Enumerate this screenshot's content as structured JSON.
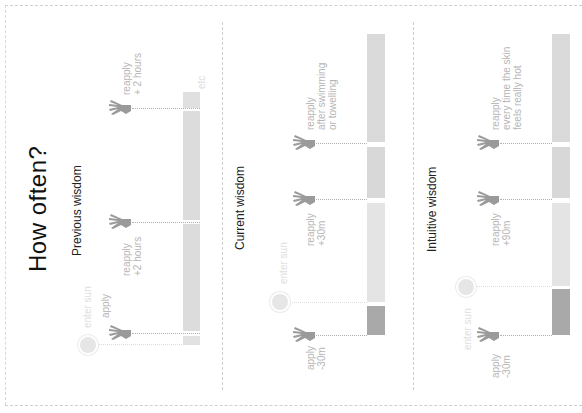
{
  "title": "How often?",
  "colors": {
    "bar_light": "#e2e2e2",
    "bar_mid": "#d6d6d6",
    "bar_dark": "#a9a9a9",
    "label": "#b5b5b5",
    "label_faint": "#dedede",
    "hand": "#9a9a9a"
  },
  "sections": [
    {
      "title": "Previous wisdom",
      "labels": {
        "enter_sun": "enter sun",
        "apply": "apply",
        "reapply1_a": "reapply",
        "reapply1_b": "+2 hours",
        "reapply2_a": "reapply",
        "reapply2_b": "+ 2 hours",
        "etc": "etc"
      }
    },
    {
      "title": "Current wisdom",
      "labels": {
        "enter_sun": "enter sun",
        "apply_a": "apply",
        "apply_b": "-30m",
        "reapply1_a": "reapply",
        "reapply1_b": "+30m",
        "reapply2_a": "reapply",
        "reapply2_b": "after swimming",
        "reapply2_c": "or towelling"
      }
    },
    {
      "title": "Intuitive wisdom",
      "labels": {
        "enter_sun": "enter sun",
        "apply_a": "apply",
        "apply_b": "-30m",
        "reapply1_a": "reapply",
        "reapply1_b": "+90m",
        "reapply2_a": "reapply",
        "reapply2_b": "every time the skin",
        "reapply2_c": "feels really hot"
      }
    }
  ]
}
